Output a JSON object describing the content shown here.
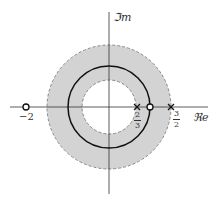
{
  "diagram": {
    "type": "pole-zero plot (z-plane) with region of convergence",
    "axes": {
      "imag_label": "ℑm",
      "real_label": "ℜe"
    },
    "roc": {
      "inner_radius_label": "2/3",
      "outer_radius_label": "3/2",
      "fill_color": "#d0d0d0",
      "border_style": "dashed"
    },
    "unit_circle": {
      "radius": 1,
      "color": "#111111"
    },
    "poles": [
      {
        "value": "2/3",
        "marker": "×"
      },
      {
        "value": "3/2",
        "marker": "×"
      }
    ],
    "zeros": [
      {
        "value": "-2",
        "marker": "○"
      },
      {
        "value": "1",
        "marker": "○"
      }
    ],
    "tick_labels": {
      "neg_two": "−2",
      "two_thirds": {
        "num": "2",
        "den": "3"
      },
      "three_halves": {
        "num": "3",
        "den": "2"
      }
    }
  }
}
